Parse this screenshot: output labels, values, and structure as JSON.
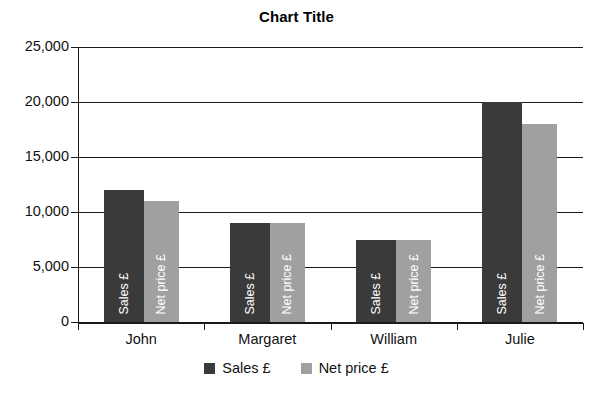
{
  "chart_data": {
    "type": "bar",
    "title": "Chart Title",
    "xlabel": "",
    "ylabel": "",
    "categories": [
      "John",
      "Margaret",
      "William",
      "Julie"
    ],
    "series": [
      {
        "name": "Sales £",
        "color": "#3a3a3a",
        "values": [
          12000,
          9000,
          7500,
          20000
        ]
      },
      {
        "name": "Net price £",
        "color": "#a0a0a0",
        "values": [
          11000,
          9000,
          7500,
          18000
        ]
      }
    ],
    "ylim": [
      0,
      25000
    ],
    "yticks": [
      0,
      5000,
      10000,
      15000,
      20000,
      25000
    ],
    "ytick_labels": [
      "0",
      "5,000",
      "10,000",
      "15,000",
      "20,000",
      "25,000"
    ],
    "grid": true,
    "grid_axis": "y",
    "legend_position": "bottom",
    "bar_inner_labels": [
      "Sales £",
      "Net price £"
    ],
    "annotations": []
  },
  "legend": {
    "items": [
      {
        "label": "Sales £",
        "color": "#3a3a3a"
      },
      {
        "label": "Net price £",
        "color": "#a0a0a0"
      }
    ]
  },
  "colors": {
    "sales": "#3a3a3a",
    "net_price": "#a0a0a0",
    "axis": "#1a1a1a",
    "background": "#ffffff",
    "text": "#111111"
  }
}
